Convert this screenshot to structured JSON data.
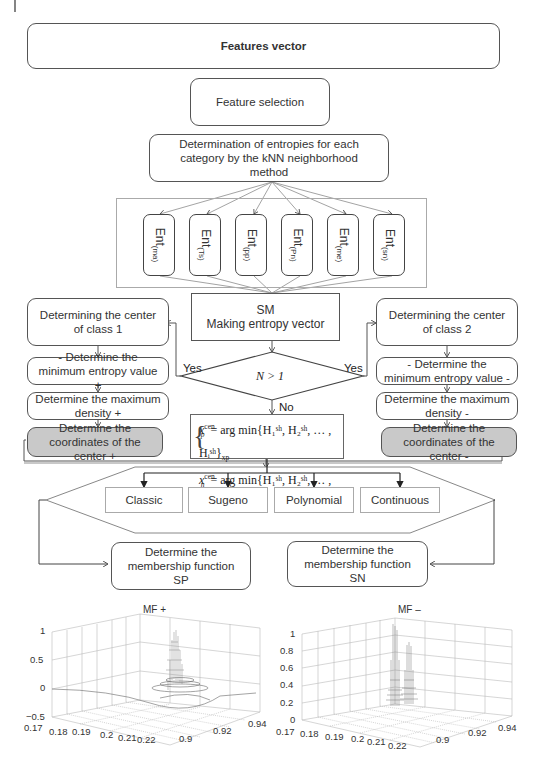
{
  "diagram": {
    "features_vector": "Features vector",
    "feature_selection": "Feature selection",
    "entropy_determination": "Determination of entropies for each category by the kNN neighborhood method",
    "entropy_categories": [
      {
        "base": "Ent",
        "sub": "(ma)"
      },
      {
        "base": "Ent",
        "sub": "(Ts)"
      },
      {
        "base": "Ent",
        "sub": "(pp)"
      },
      {
        "base": "Ent",
        "sub": "(Pn)"
      },
      {
        "base": "Ent",
        "sub": "(me)"
      },
      {
        "base": "Ent",
        "sub": "(sn)"
      }
    ],
    "sm_title": "SM",
    "sm_subtitle": "Making entropy vector",
    "decision": "N > 1",
    "yes_left": "Yes",
    "yes_right": "Yes",
    "no_label": "No",
    "class1": {
      "center": "Determining the center of class 1",
      "min_entropy": "- Determine the minimum entropy value +",
      "max_density": "Determine the maximum density +",
      "coordinates": "Determine the coordinates of the center +"
    },
    "class2": {
      "center": "Determining the center of class 2",
      "min_entropy": "- Determine the minimum entropy value -",
      "max_density": "Determine the maximum density -",
      "coordinates": "Determine the coordinates of the center -"
    },
    "formula": {
      "line1_var": "x",
      "line1_sup": "cen",
      "line1_sub": "p",
      "line1_rhs": "= arg min{H₁ˢʰ, H₂ˢʰ, … , Hᵢˢʰ}",
      "line1_tail": "xp",
      "line2_var": "x",
      "line2_sup": "cen",
      "line2_sub": "n",
      "line2_rhs": "= arg min{H₁ˢʰ, H₂ˢʰ, … , Hᵢˢʰ}",
      "line2_tail": "xn"
    },
    "mf_types": [
      "Classic",
      "Sugeno",
      "Polynomial",
      "Continuous"
    ],
    "membership_sp": "Determine the membership function SP",
    "membership_sn": "Determine the membership function SN"
  },
  "plots": [
    {
      "title": "MF +",
      "z_ticks": [
        "1",
        "0.5",
        "0",
        "−0.5"
      ],
      "x_ticks": [
        "0.17",
        "0.18",
        "0.19",
        "0.2",
        "0.21",
        "0.22"
      ],
      "y_ticks": [
        "0.9",
        "0.92",
        "0.94"
      ]
    },
    {
      "title": "MF –",
      "z_ticks": [
        "1",
        "0.8",
        "0.6",
        "0.4",
        "0.2",
        "0"
      ],
      "x_ticks": [
        "0.17",
        "0.18",
        "0.19",
        "0.2",
        "0.21",
        "0.22"
      ],
      "y_ticks": [
        "0.9",
        "0.92",
        "0.94"
      ]
    }
  ]
}
